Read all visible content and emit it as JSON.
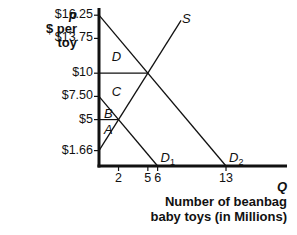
{
  "chart_data": {
    "type": "line",
    "title": "",
    "ylabel": {
      "symbol": "p",
      "text": "$ per toy"
    },
    "xlabel": {
      "symbol": "Q",
      "text": "Number of beanbag baby toys (in Millions)"
    },
    "y_ticks": [
      {
        "label": "$16.25",
        "value": 16.25
      },
      {
        "label": "$13.75",
        "value": 13.75
      },
      {
        "label": "$10",
        "value": 10
      },
      {
        "label": "$7.50",
        "value": 7.5
      },
      {
        "label": "$5",
        "value": 5
      },
      {
        "label": "$1.66",
        "value": 1.66
      }
    ],
    "x_ticks": [
      {
        "label": "2",
        "value": 2
      },
      {
        "label": "5",
        "value": 5
      },
      {
        "label": "6",
        "value": 6
      },
      {
        "label": "13",
        "value": 13
      }
    ],
    "series": [
      {
        "name": "D1",
        "label": "D",
        "sub": "1",
        "points": [
          [
            0,
            7.5
          ],
          [
            6,
            0
          ]
        ]
      },
      {
        "name": "D2",
        "label": "D",
        "sub": "2",
        "points": [
          [
            0,
            16.25
          ],
          [
            13,
            0
          ]
        ]
      },
      {
        "name": "S",
        "label": "S",
        "points": [
          [
            0,
            1.66
          ],
          [
            8.4,
            15.7
          ]
        ]
      }
    ],
    "reference_lines": [
      {
        "type": "horizontal",
        "y": 10,
        "x_from": 0,
        "x_to": 5
      },
      {
        "type": "horizontal",
        "y": 5,
        "x_from": 0,
        "x_to": 2
      }
    ],
    "area_labels": [
      {
        "label": "D",
        "x": 1.3,
        "y": 11.8
      },
      {
        "label": "C",
        "x": 1.3,
        "y": 8.1
      },
      {
        "label": "B",
        "x": 0.5,
        "y": 5.7
      },
      {
        "label": "A",
        "x": 0.5,
        "y": 4.0
      }
    ],
    "xlim": [
      0,
      19.4
    ],
    "ylim": [
      0,
      17.5
    ],
    "grid": false,
    "legend": "none"
  }
}
